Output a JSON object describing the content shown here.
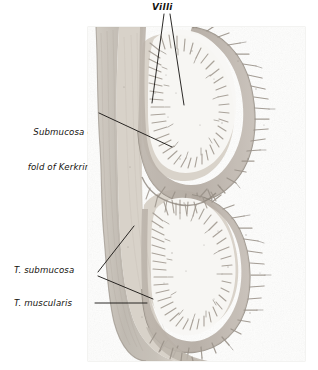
{
  "figure": {
    "kind": "histology-plate",
    "background": "#ffffff",
    "plate": {
      "x": 88,
      "y": 27,
      "width": 217,
      "height": 334,
      "paper_color": "#fdfdfc",
      "border_color": "#e8e7e4"
    }
  },
  "labels": [
    {
      "id": "villi",
      "text": "Villi",
      "style": "bold-italic",
      "x": 152,
      "y": 2,
      "color": "#15130f"
    },
    {
      "id": "submucosa-of-fold-of-kerkring",
      "line1": "Submucosa of",
      "line2": "fold of Kerkring",
      "style": "italic",
      "x": 14,
      "y": 104,
      "color": "#15130f"
    },
    {
      "id": "t-submucosa",
      "text": "T. submucosa",
      "style": "italic",
      "x": 14,
      "y": 265,
      "color": "#15130f"
    },
    {
      "id": "t-muscularis",
      "text": "T. muscularis",
      "style": "italic",
      "x": 14,
      "y": 298,
      "color": "#15130f"
    }
  ],
  "leader_lines": [
    {
      "id": "villi-leader-left",
      "from": [
        164,
        14
      ],
      "to": [
        152,
        103
      ],
      "color": "#141210"
    },
    {
      "id": "villi-leader-right",
      "from": [
        170,
        14
      ],
      "to": [
        184,
        105
      ],
      "color": "#141210"
    },
    {
      "id": "submucosa-fold-leader",
      "from": [
        99,
        113
      ],
      "to": [
        172,
        147
      ],
      "color": "#141210"
    },
    {
      "id": "t-submucosa-leader-up",
      "from": [
        98,
        272
      ],
      "to": [
        134,
        226
      ],
      "color": "#141210"
    },
    {
      "id": "t-submucosa-leader-down",
      "from": [
        98,
        276
      ],
      "to": [
        153,
        299
      ],
      "color": "#141210"
    },
    {
      "id": "t-muscularis-leader",
      "from": [
        95,
        303
      ],
      "to": [
        147,
        303
      ],
      "color": "#141210"
    }
  ],
  "tissue_colors": {
    "serosa_muscularis": "#b8b1a8",
    "submucosa": "#cac2b8",
    "mucosa_villi": "#a99f95",
    "crypt_shadow": "#8a8076",
    "lumen": "#f7f6f3",
    "ink_dark": "#6d645b",
    "paper": "#fdfdfc"
  },
  "structures": [
    {
      "name": "villi",
      "label_ref": "villi"
    },
    {
      "name": "fold-of-kerkring-submucosal-core",
      "label_ref": "submucosa-of-fold-of-kerkring"
    },
    {
      "name": "tunica-submucosa",
      "label_ref": "t-submucosa"
    },
    {
      "name": "tunica-muscularis",
      "label_ref": "t-muscularis"
    }
  ]
}
